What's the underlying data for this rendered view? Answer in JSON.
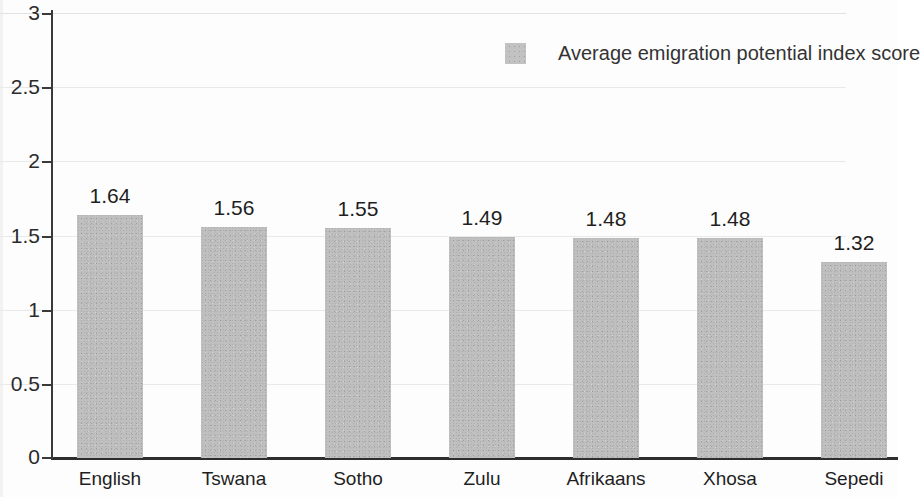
{
  "chart_data": {
    "type": "bar",
    "title": "",
    "subtitle": "",
    "xlabel": "",
    "ylabel": "",
    "categories": [
      "English",
      "Tswana",
      "Sotho",
      "Zulu",
      "Afrikaans",
      "Xhosa",
      "Sepedi"
    ],
    "values": [
      1.64,
      1.56,
      1.55,
      1.49,
      1.48,
      1.48,
      1.32
    ],
    "value_labels": [
      "1.64",
      "1.56",
      "1.55",
      "1.49",
      "1.48",
      "1.48",
      "1.32"
    ],
    "series": [
      {
        "name": "Average emigration potential index score",
        "values": [
          1.64,
          1.56,
          1.55,
          1.49,
          1.48,
          1.48,
          1.32
        ],
        "color": "#bfbfbf"
      }
    ],
    "ylim": [
      0,
      3
    ],
    "ytick_values": [
      3,
      2.5,
      2,
      1.5,
      1,
      0.5,
      0
    ],
    "ytick_labels": [
      "3",
      "2.5",
      "2",
      "1.5",
      "1",
      "0.5",
      "0"
    ],
    "grid": true,
    "grid_axis": "y",
    "legend": {
      "position": "top-right",
      "entries": [
        {
          "label": "Average emigration potential index score",
          "color": "#bfbfbf"
        }
      ]
    },
    "bar_color": "#bfbfbf",
    "background_color": "#fdfdfd",
    "axis_color": "#2e2e2e",
    "gridline_color": "#e2e2e2",
    "text_color": "#1f1f1f"
  }
}
